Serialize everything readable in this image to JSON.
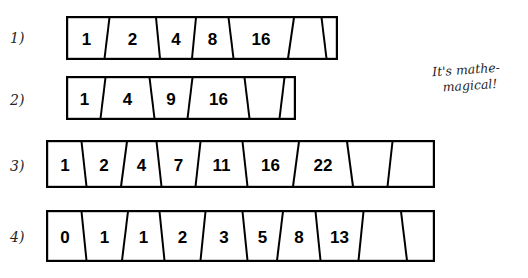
{
  "page": {
    "background_color": "#ffffff",
    "ink_color": "#000000"
  },
  "note": {
    "line1": "It's mathe-",
    "line2": "magical!"
  },
  "rows": [
    {
      "label": "1)",
      "values": [
        "1",
        "2",
        "4",
        "8",
        "16"
      ],
      "empty_cells": 2,
      "x": 66,
      "y": 16,
      "width": 272,
      "height": 44,
      "label_x": 10,
      "label_y": 30,
      "cell_edges": [
        0,
        41,
        92,
        128,
        165,
        225,
        258,
        272
      ],
      "slants": [
        0,
        5,
        -4,
        4,
        -5,
        6,
        -5,
        0
      ]
    },
    {
      "label": "2)",
      "values": [
        "1",
        "4",
        "9",
        "16"
      ],
      "empty_cells": 2,
      "x": 66,
      "y": 76,
      "width": 230,
      "height": 44,
      "label_x": 10,
      "label_y": 92,
      "cell_edges": [
        0,
        37,
        86,
        124,
        181,
        216,
        230
      ],
      "slants": [
        0,
        5,
        -5,
        5,
        -5,
        5,
        0
      ]
    },
    {
      "label": "3)",
      "values": [
        "1",
        "2",
        "4",
        "7",
        "11",
        "16",
        "22"
      ],
      "empty_cells": 2,
      "x": 46,
      "y": 140,
      "width": 389,
      "height": 48,
      "label_x": 10,
      "label_y": 158,
      "cell_edges": [
        0,
        38,
        78,
        113,
        152,
        199,
        250,
        304,
        344,
        389
      ],
      "slants": [
        0,
        -5,
        6,
        -5,
        5,
        -5,
        6,
        -6,
        5,
        0
      ]
    },
    {
      "label": "4)",
      "values": [
        "0",
        "1",
        "1",
        "2",
        "3",
        "5",
        "8",
        "13"
      ],
      "empty_cells": 2,
      "x": 46,
      "y": 210,
      "width": 389,
      "height": 52,
      "label_x": 10,
      "label_y": 229,
      "cell_edges": [
        0,
        38,
        79,
        116,
        157,
        199,
        234,
        272,
        315,
        358,
        389
      ],
      "slants": [
        0,
        -5,
        6,
        -5,
        5,
        -5,
        6,
        -5,
        5,
        -6,
        0
      ]
    }
  ]
}
